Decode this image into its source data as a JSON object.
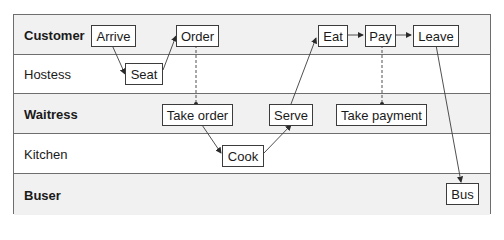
{
  "diagram": {
    "type": "swimlane",
    "lanes": [
      {
        "label": "Customer",
        "bold": true
      },
      {
        "label": "Hostess",
        "bold": false
      },
      {
        "label": "Waitress",
        "bold": true
      },
      {
        "label": "Kitchen",
        "bold": false
      },
      {
        "label": "Buser",
        "bold": true
      }
    ],
    "nodes": {
      "arrive": "Arrive",
      "order": "Order",
      "eat": "Eat",
      "pay": "Pay",
      "leave": "Leave",
      "seat": "Seat",
      "take_order": "Take order",
      "serve": "Serve",
      "take_payment": "Take payment",
      "cook": "Cook",
      "bus": "Bus"
    },
    "edges": [
      {
        "from": "Arrive",
        "to": "Seat",
        "style": "arrow"
      },
      {
        "from": "Seat",
        "to": "Order",
        "style": "arrow"
      },
      {
        "from": "Order",
        "to": "Take order",
        "style": "dashed-connector"
      },
      {
        "from": "Take order",
        "to": "Cook",
        "style": "arrow"
      },
      {
        "from": "Cook",
        "to": "Serve",
        "style": "arrow"
      },
      {
        "from": "Serve",
        "to": "Eat",
        "style": "arrow"
      },
      {
        "from": "Eat",
        "to": "Pay",
        "style": "arrow"
      },
      {
        "from": "Pay",
        "to": "Take payment",
        "style": "dashed-connector"
      },
      {
        "from": "Pay",
        "to": "Leave",
        "style": "arrow"
      },
      {
        "from": "Leave",
        "to": "Bus",
        "style": "arrow"
      }
    ]
  }
}
